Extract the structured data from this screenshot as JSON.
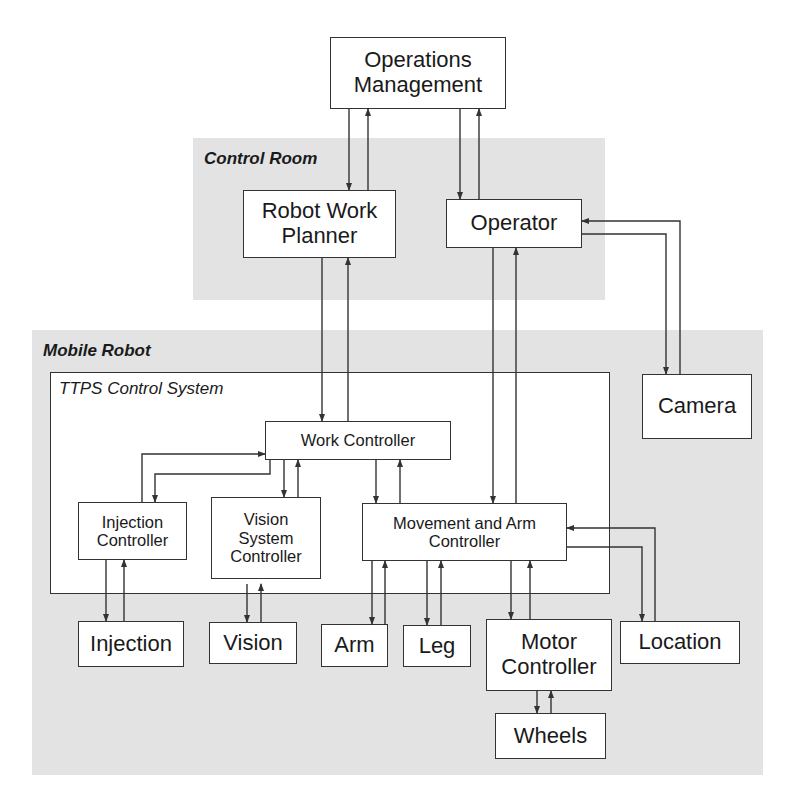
{
  "regions": {
    "control_room": {
      "label": "Control Room"
    },
    "mobile_robot": {
      "label": "Mobile Robot"
    },
    "ttps": {
      "label": "TTPS Control System"
    }
  },
  "nodes": {
    "operations_management": "Operations\nManagement",
    "robot_work_planner": "Robot Work\nPlanner",
    "operator": "Operator",
    "camera": "Camera",
    "work_controller": "Work Controller",
    "injection_controller": "Injection\nController",
    "vision_system_controller": "Vision\nSystem\nController",
    "movement_arm_controller": "Movement and Arm\nController",
    "injection": "Injection",
    "vision": "Vision",
    "arm": "Arm",
    "leg": "Leg",
    "motor_controller": "Motor\nController",
    "location": "Location",
    "wheels": "Wheels"
  },
  "edges": [
    {
      "from": "Operations Management",
      "to": "Robot Work Planner",
      "bidirectional": true
    },
    {
      "from": "Operations Management",
      "to": "Operator",
      "bidirectional": true
    },
    {
      "from": "Operator",
      "to": "Camera",
      "bidirectional": true
    },
    {
      "from": "Robot Work Planner",
      "to": "Work Controller",
      "bidirectional": true
    },
    {
      "from": "Operator",
      "to": "Movement and Arm Controller",
      "bidirectional": true
    },
    {
      "from": "Work Controller",
      "to": "Injection Controller",
      "bidirectional": true
    },
    {
      "from": "Work Controller",
      "to": "Vision System Controller",
      "bidirectional": true
    },
    {
      "from": "Work Controller",
      "to": "Movement and Arm Controller",
      "bidirectional": true
    },
    {
      "from": "Injection Controller",
      "to": "Injection",
      "bidirectional": true
    },
    {
      "from": "Vision System Controller",
      "to": "Vision",
      "bidirectional": true
    },
    {
      "from": "Movement and Arm Controller",
      "to": "Arm",
      "bidirectional": true
    },
    {
      "from": "Movement and Arm Controller",
      "to": "Leg",
      "bidirectional": true
    },
    {
      "from": "Movement and Arm Controller",
      "to": "Motor Controller",
      "bidirectional": true
    },
    {
      "from": "Movement and Arm Controller",
      "to": "Location",
      "bidirectional": true
    },
    {
      "from": "Motor Controller",
      "to": "Wheels",
      "bidirectional": true
    }
  ],
  "colors": {
    "region_fill": "#e3e3e3",
    "line": "#333333",
    "box_fill": "#ffffff"
  }
}
